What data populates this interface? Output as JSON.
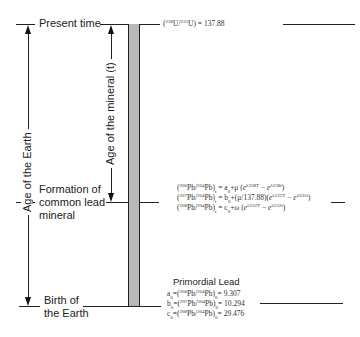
{
  "labels": {
    "present_time": "Present time",
    "formation_line1": "Formation of",
    "formation_line2": "common lead",
    "formation_line3": "mineral",
    "birth_line1": "Birth of",
    "birth_line2": "the Earth",
    "age_of_earth": "Age of the Earth",
    "age_of_mineral": "Age of the mineral (t)"
  },
  "equations": {
    "uranium_ratio": "(238U/235U) = 137.88",
    "pb206": "(206Pb/204Pb)t = a0 + μ (eλ238T − eλ238t)",
    "pb207": "(207Pb/204Pb)t = b0 + (μ/137.88)(eλ235T − eλ235t)",
    "pb208": "(208Pb/204Pb)t = c0 + ω (eλ232T − eλ232t)"
  },
  "primordial": {
    "title": "Primordial Lead",
    "a0": "a0 = (206Pb/204Pb)0 = 9.307",
    "b0": "b0 = (207Pb/204Pb)0 = 10.294",
    "c0": "c0 = (208Pb/204Pb)0 = 29.476",
    "a0_value": "9.307",
    "b0_value": "10.294",
    "c0_value": "29.476",
    "u_ratio_value": "137.88"
  },
  "colors": {
    "bar_fill": "#b8b8b8",
    "line": "#222222"
  }
}
